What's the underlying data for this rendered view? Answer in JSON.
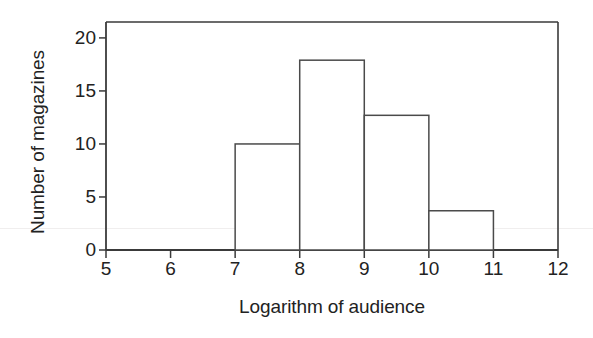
{
  "chart_data": {
    "type": "bar",
    "title": "",
    "subtitle": "",
    "xlabel": "Logarithm of audience",
    "ylabel": "Number of magazines",
    "xlim": [
      5,
      12
    ],
    "ylim": [
      0,
      21.5
    ],
    "xticks": [
      5,
      6,
      7,
      8,
      9,
      10,
      11,
      12
    ],
    "xtick_labels": [
      "5",
      "6",
      "7",
      "8",
      "9",
      "10",
      "11",
      "12"
    ],
    "yticks": [
      0,
      5,
      10,
      15,
      20
    ],
    "ytick_labels": [
      "0",
      "5",
      "10",
      "15",
      "20"
    ],
    "grid": false,
    "legend": null,
    "bin_width": 1,
    "bins": [
      {
        "x0": 7,
        "x1": 8,
        "value": 10
      },
      {
        "x0": 8,
        "x1": 9,
        "value": 17.9
      },
      {
        "x0": 9,
        "x1": 10,
        "value": 12.7
      },
      {
        "x0": 10,
        "x1": 11,
        "value": 3.7
      }
    ],
    "categories": [
      "7-8",
      "8-9",
      "9-10",
      "10-11"
    ],
    "values": [
      10,
      17.9,
      12.7,
      3.7
    ],
    "bar_fill": "#ffffff",
    "bar_stroke": "#4a4a4a",
    "axis_color": "#3a3a3a",
    "background": "#ffffff"
  },
  "figure": {
    "frame_drawn": true,
    "frame_sides": [
      "top",
      "right",
      "bottom",
      "left"
    ]
  }
}
